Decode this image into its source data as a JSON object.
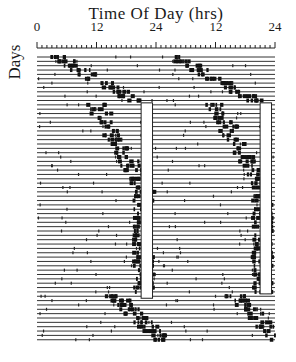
{
  "chart_data": {
    "type": "heatmap",
    "subtype": "double-plotted actogram",
    "title": "Time Of Day (hrs)",
    "xlabel": "Time Of Day (hrs)",
    "ylabel": "Days",
    "x_ticks": [
      "0",
      "12",
      "24",
      "12",
      "24"
    ],
    "x_range_hours": [
      0,
      48
    ],
    "minor_tick_interval_hours": 1,
    "num_days": 66,
    "grid": false,
    "legend": null,
    "annotations": [
      {
        "type": "open-rectangle",
        "plot": "first",
        "x_hours": [
          21,
          23.3
        ],
        "day_range": [
          11,
          55
        ]
      },
      {
        "type": "open-rectangle",
        "plot": "second",
        "x_hours": [
          45,
          47.3
        ],
        "day_range": [
          11,
          54
        ]
      }
    ]
  },
  "labels": {
    "title": "Time Of Day (hrs)",
    "ylabel": "Days",
    "ticks": [
      "0",
      "12",
      "24",
      "12",
      "24"
    ]
  }
}
